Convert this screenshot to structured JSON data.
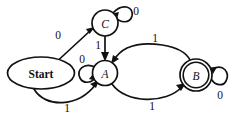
{
  "diagram": {
    "type": "finite-state-machine",
    "title": "",
    "background_color": "#ffffff",
    "stroke_color": "#111111",
    "nodes": [
      {
        "id": "start",
        "label": "Start",
        "shape": "ellipse",
        "accepting": false,
        "cx": 41,
        "cy": 73,
        "rx": 33.5,
        "ry": 16
      },
      {
        "id": "C",
        "label": "C",
        "shape": "circle",
        "accepting": false,
        "cx": 105,
        "cy": 23,
        "r": 13
      },
      {
        "id": "A",
        "label": "A",
        "shape": "circle",
        "accepting": false,
        "cx": 105,
        "cy": 73,
        "r": 12.5
      },
      {
        "id": "B",
        "label": "B",
        "shape": "double-circle",
        "accepting": true,
        "cx": 196,
        "cy": 75,
        "r": 16,
        "r_inner": 12.8
      }
    ],
    "edges": [
      {
        "id": "start-to-C",
        "from": "start",
        "to": "C",
        "label": "0",
        "label_x": 58,
        "label_y": 35,
        "kind": "straight"
      },
      {
        "id": "start-to-A",
        "from": "start",
        "to": "A",
        "label": "1",
        "label_x": 67,
        "label_y": 108,
        "kind": "curve-below"
      },
      {
        "id": "C-to-A",
        "from": "C",
        "to": "A",
        "label": "1",
        "label_x": 98,
        "label_y": 45,
        "kind": "straight-vertical"
      },
      {
        "id": "C-self-loop",
        "from": "C",
        "to": "C",
        "label": "0",
        "label_x": 136,
        "label_y": 11,
        "kind": "self-loop-top-right"
      },
      {
        "id": "A-self-loop",
        "from": "A",
        "to": "A",
        "label": "0",
        "label_x": 82,
        "label_y": 59,
        "kind": "self-loop-left"
      },
      {
        "id": "A-to-B",
        "from": "A",
        "to": "B",
        "label": "1",
        "label_x": 152,
        "label_y": 106,
        "kind": "curve-below"
      },
      {
        "id": "B-to-A",
        "from": "B",
        "to": "A",
        "label": "1",
        "label_x": 155,
        "label_y": 38,
        "kind": "curve-above"
      },
      {
        "id": "B-self-loop",
        "from": "B",
        "to": "B",
        "label": "0",
        "label_x": 220,
        "label_y": 95,
        "kind": "self-loop-right"
      }
    ],
    "alphabet": [
      "0",
      "1"
    ],
    "start_state": "start",
    "accepting_states": [
      "B"
    ]
  }
}
